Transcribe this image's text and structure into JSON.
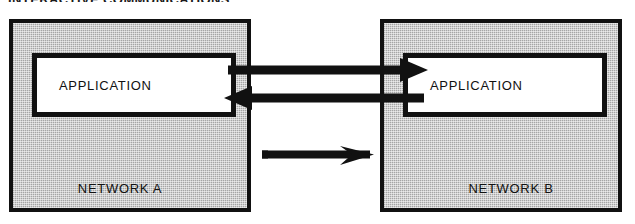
{
  "figure": {
    "title": "INTERACTIVE COMMUNICATIONS",
    "type": "network-communication-diagram",
    "colors": {
      "panel_fill": "#c9c9c9",
      "stroke": "#111111",
      "box_fill": "#ffffff",
      "background": "#ffffff"
    }
  },
  "panels": [
    {
      "id": "network-a",
      "label": "NETWORK A",
      "application_label": "APPLICATION"
    },
    {
      "id": "network-b",
      "label": "NETWORK B",
      "application_label": "APPLICATION"
    }
  ],
  "connections": [
    {
      "id": "arrow-top",
      "direction": "right",
      "from": "network-a-application",
      "to": "network-b-application"
    },
    {
      "id": "arrow-middle",
      "direction": "left",
      "from": "network-b-application",
      "to": "network-a-application"
    },
    {
      "id": "arrow-bottom",
      "direction": "right",
      "from": "network-a",
      "to": "network-b"
    }
  ]
}
